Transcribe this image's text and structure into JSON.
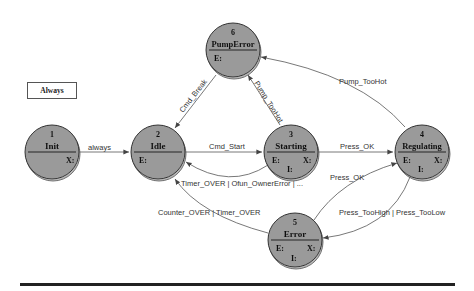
{
  "legend": {
    "label": "Always"
  },
  "states": [
    {
      "id": "1",
      "name": "Init",
      "actions": [
        "X:"
      ]
    },
    {
      "id": "2",
      "name": "Idle",
      "actions": [
        "E:"
      ]
    },
    {
      "id": "3",
      "name": "Starting",
      "actions": [
        "E:",
        "X:",
        "I:"
      ]
    },
    {
      "id": "4",
      "name": "Regulating",
      "actions": [
        "E:",
        "X:",
        "I:"
      ]
    },
    {
      "id": "5",
      "name": "Error",
      "actions": [
        "E:",
        "X:",
        "I:"
      ]
    },
    {
      "id": "6",
      "name": "PumpError",
      "actions": [
        "E:"
      ]
    }
  ],
  "transitions": [
    {
      "from": "Init",
      "to": "Idle",
      "label": "always"
    },
    {
      "from": "Idle",
      "to": "Starting",
      "label": "Cmd_Start"
    },
    {
      "from": "Starting",
      "to": "Regulating",
      "label": "Press_OK"
    },
    {
      "from": "PumpError",
      "to": "Idle",
      "label": "Cmd_Break"
    },
    {
      "from": "Starting",
      "to": "PumpError",
      "label": "Pump_TooHot"
    },
    {
      "from": "Regulating",
      "to": "PumpError",
      "label": "Pump_TooHot"
    },
    {
      "from": "Starting",
      "to": "Idle",
      "label": "Timer_OVER | Ofun_OwnerError | ..."
    },
    {
      "from": "Error",
      "to": "Idle",
      "label": "Counter_OVER | Timer_OVER"
    },
    {
      "from": "Error",
      "to": "Regulating",
      "label": "Press_OK"
    },
    {
      "from": "Regulating",
      "to": "Error",
      "label": "Press_TooHigh | Press_TooLow"
    }
  ],
  "colors": {
    "state_fill": "#9a9a9a",
    "stroke": "#333333",
    "edge": "#555555"
  }
}
